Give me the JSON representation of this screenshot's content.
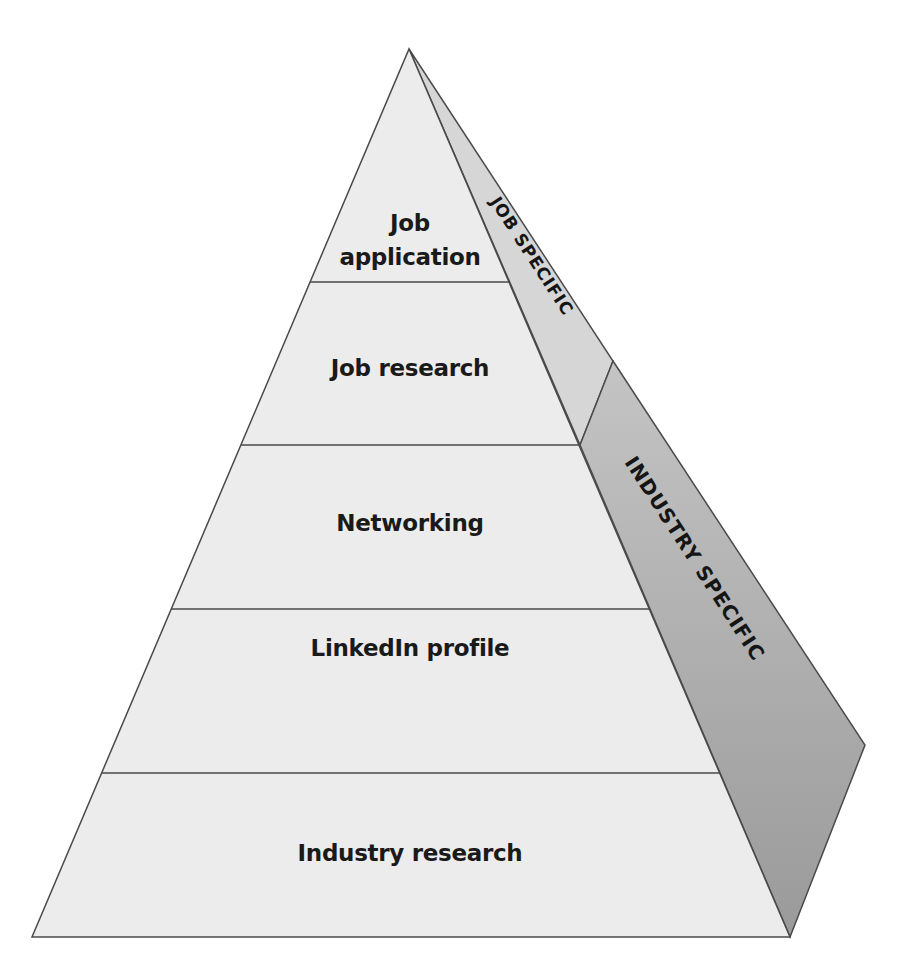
{
  "diagram": {
    "type": "pyramid",
    "levels": [
      {
        "label_line1": "Job",
        "label_line2": "application"
      },
      {
        "label": "Job research"
      },
      {
        "label": "Networking"
      },
      {
        "label": "LinkedIn profile"
      },
      {
        "label": "Industry research"
      }
    ],
    "side_labels": {
      "top": "JOB SPECIFIC",
      "bottom": "INDUSTRY SPECIFIC"
    },
    "colors": {
      "front_face": "#ececec",
      "side_top": "#d2d2d2",
      "side_bottom": "#a8a8a8",
      "lines": "#4a4a4a"
    }
  }
}
